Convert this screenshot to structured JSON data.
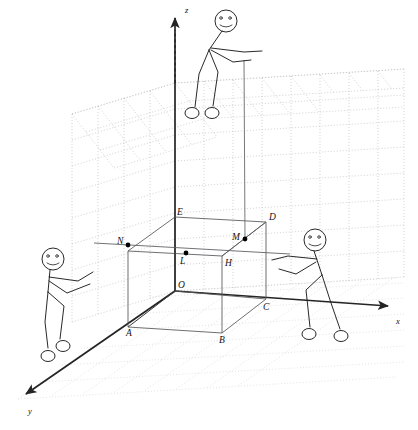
{
  "figure": {
    "background_color": "#ffffff",
    "ink_color": "#1e1e1e",
    "grid_color": "#b9b9bd"
  },
  "axes": [
    {
      "id": "z",
      "label": "z",
      "label_x": 185,
      "label_y": 13,
      "direction": "up"
    },
    {
      "id": "x",
      "label": "x",
      "label_x": 396,
      "label_y": 324,
      "direction": "right"
    },
    {
      "id": "y",
      "label": "y",
      "label_x": 28,
      "label_y": 414,
      "direction": "down-left"
    }
  ],
  "points": [
    {
      "name": "O",
      "label": "O",
      "x": 175,
      "y": 291,
      "label_x": 178,
      "label_y": 288,
      "dot": false
    },
    {
      "name": "A",
      "label": "A",
      "x": 128,
      "y": 327,
      "label_x": 126,
      "label_y": 336,
      "dot": false
    },
    {
      "name": "B",
      "label": "B",
      "x": 222,
      "y": 333,
      "label_x": 220,
      "label_y": 342,
      "dot": false
    },
    {
      "name": "C",
      "label": "C",
      "x": 266,
      "y": 299,
      "label_x": 264,
      "label_y": 309,
      "dot": false
    },
    {
      "name": "D",
      "label": "D",
      "x": 266,
      "y": 222,
      "label_x": 269,
      "label_y": 219,
      "dot": false
    },
    {
      "name": "E",
      "label": "E",
      "x": 175,
      "y": 217,
      "label_x": 178,
      "label_y": 214,
      "dot": false
    },
    {
      "name": "H",
      "label": "H",
      "x": 222,
      "y": 256,
      "label_x": 226,
      "label_y": 265,
      "dot": false
    },
    {
      "name": "L",
      "label": "L",
      "x": 186,
      "y": 253,
      "label_x": 181,
      "label_y": 263,
      "dot": true
    },
    {
      "name": "M",
      "label": "M",
      "x": 245,
      "y": 239,
      "label_x": 234,
      "label_y": 238,
      "dot": true
    },
    {
      "name": "N",
      "label": "N",
      "x": 128,
      "y": 245,
      "label_x": 119,
      "label_y": 243,
      "dot": true
    }
  ],
  "figures": [
    {
      "id": "figure-top",
      "name": "stick-figure-top",
      "pose": "reaching-down-holding-vertical-rod"
    },
    {
      "id": "figure-left",
      "name": "stick-figure-left",
      "pose": "pointing-right-arm-forward"
    },
    {
      "id": "figure-right",
      "name": "stick-figure-right",
      "pose": "pointing-left-arm-forward"
    }
  ],
  "annotations": {
    "vertical_rod": "line from top figure hand down to point M",
    "line_NL": "horizontal segment through N and L extending to the right",
    "box": "rectangular box O-A-B-C / E-...-D with hidden interior edges"
  }
}
